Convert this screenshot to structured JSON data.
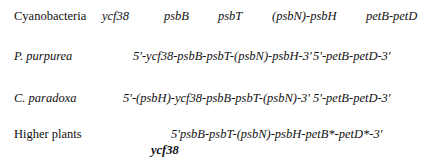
{
  "rows": [
    {
      "organism": "Cyanobacteria",
      "genes": [
        "ycf38",
        "psbB",
        "psbT",
        "(psbN)-psbH",
        "petB-petD"
      ]
    },
    {
      "organism": "P. purpurea",
      "cluster1": "5'-ycf38-psbB-psbT-(psbN)-psbH-3'",
      "cluster2": "5'-petB-petD-3'"
    },
    {
      "organism": "C. paradoxa",
      "cluster1": "5'-(psbH)-ycf38-psbB-psbT-(psbN)-3'",
      "cluster2": "5'-petB-petD-3'"
    },
    {
      "organism": "Higher plants",
      "cluster1": "5'psbB-psbT-(psbN)-psbH-petB*-petD*-3'",
      "insertion": "ycf38"
    }
  ]
}
